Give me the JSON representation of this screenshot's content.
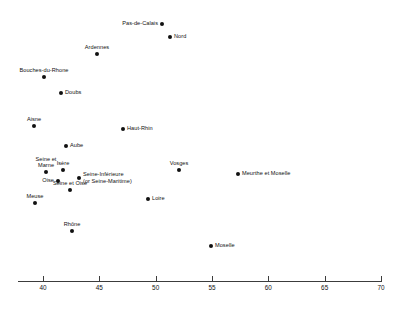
{
  "chart_data": {
    "type": "scatter",
    "title": "",
    "subtitle": "",
    "xlabel": "",
    "ylabel": "",
    "xlim": [
      38.5,
      70.5
    ],
    "xticks": [
      40,
      45,
      50,
      55,
      60,
      65,
      70
    ],
    "xtick_labels": [
      "40",
      "45",
      "50",
      "55",
      "60",
      "65",
      "70"
    ],
    "ylim": [
      0,
      1
    ],
    "grid": false,
    "legend": "none",
    "y_axis_visible": false,
    "marker_color": "#111111",
    "axis_color": "#3c3c3c",
    "points": [
      {
        "label": "Pas-de-Calais",
        "x": 50.6,
        "y": 0.909,
        "px": 162,
        "py": 24,
        "label_pos": "left"
      },
      {
        "label": "Nord",
        "x": 51.3,
        "y": 0.861,
        "px": 170,
        "py": 37,
        "label_pos": "right"
      },
      {
        "label": "Ardennes",
        "x": 45.0,
        "y": 0.799,
        "px": 97,
        "py": 54,
        "label_pos": "above"
      },
      {
        "label": "Bouches-du-Rhone",
        "x": 40.3,
        "y": 0.714,
        "px": 44,
        "py": 77,
        "label_pos": "above"
      },
      {
        "label": "Doubs",
        "x": 41.8,
        "y": 0.655,
        "px": 61,
        "py": 93,
        "label_pos": "right"
      },
      {
        "label": "Aisne",
        "x": 39.4,
        "y": 0.534,
        "px": 34,
        "py": 126,
        "label_pos": "above"
      },
      {
        "label": "Haut-Rhin",
        "x": 47.3,
        "y": 0.524,
        "px": 123,
        "py": 129,
        "label_pos": "right"
      },
      {
        "label": "Aube",
        "x": 42.3,
        "y": 0.462,
        "px": 66,
        "py": 146,
        "label_pos": "right"
      },
      {
        "label": "Seine et Marne",
        "x": 40.5,
        "y": 0.365,
        "px": 46,
        "py": 172,
        "label_pos": "above-two"
      },
      {
        "label": "Isere",
        "x": 42.0,
        "y": 0.372,
        "px": 63,
        "py": 170,
        "label_pos": "above"
      },
      {
        "label": "Vosges",
        "x": 52.1,
        "y": 0.372,
        "px": 179,
        "py": 170,
        "label_pos": "above"
      },
      {
        "label": "Meurthe et Moselle",
        "x": 57.4,
        "y": 0.358,
        "px": 238,
        "py": 174,
        "label_pos": "right"
      },
      {
        "label": "Oise",
        "x": 41.6,
        "y": 0.339,
        "px": 58,
        "py": 181,
        "label_pos": "left"
      },
      {
        "label": "Seine-Inferieure (or Seine-Maritime)",
        "x": 43.4,
        "y": 0.35,
        "px": 79,
        "py": 178,
        "label_pos": "right-two"
      },
      {
        "label": "Seine et Oise",
        "x": 42.6,
        "y": 0.306,
        "px": 70,
        "py": 190,
        "label_pos": "above"
      },
      {
        "label": "Meuse",
        "x": 39.5,
        "y": 0.259,
        "px": 35,
        "py": 203,
        "label_pos": "above"
      },
      {
        "label": "Loire",
        "x": 49.4,
        "y": 0.273,
        "px": 148,
        "py": 199,
        "label_pos": "right"
      },
      {
        "label": "Rhone",
        "x": 42.8,
        "y": 0.153,
        "px": 72,
        "py": 231,
        "label_pos": "above"
      },
      {
        "label": "Moselle",
        "x": 55.2,
        "y": 0.098,
        "px": 211,
        "py": 246,
        "label_pos": "right"
      }
    ]
  }
}
